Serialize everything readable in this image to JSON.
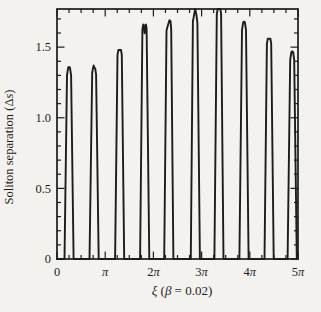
{
  "figure": {
    "background": "#f3f2ee",
    "ink": "#1c1c1c"
  },
  "chart_data": {
    "type": "line",
    "title": "",
    "xlabel": "ξ (β = 0.02)",
    "ylabel": "Soliton separation (Δs)",
    "xlabel_parts": [
      {
        "text": "ξ",
        "italic": true
      },
      {
        "text": " (",
        "italic": false
      },
      {
        "text": "β",
        "italic": true
      },
      {
        "text": " = 0.02)",
        "italic": false
      }
    ],
    "ylabel_parts": [
      {
        "text": "Soliton separation (Δ",
        "italic": false
      },
      {
        "text": "s",
        "italic": true
      },
      {
        "text": ")",
        "italic": false
      }
    ],
    "xlim_pi": [
      0,
      5
    ],
    "ylim": [
      0,
      1.77
    ],
    "x_major_ticks_pi": [
      0,
      1,
      2,
      3,
      4,
      5
    ],
    "x_tick_labels": [
      "0",
      "π",
      "2π",
      "3π",
      "4π",
      "5π"
    ],
    "x_minor_step_pi": 0.25,
    "y_major_ticks": [
      0,
      0.5,
      1.0,
      1.5
    ],
    "y_tick_labels": [
      "0",
      "0.5",
      "1.0",
      "1.5"
    ],
    "y_minor_step": 0.1,
    "grid": false,
    "legend": null,
    "series": [
      {
        "name": "soliton-separation",
        "color": "#1c1c1c",
        "baseline": 0,
        "spike_halfwidth_base_pi": 0.095,
        "spikes": [
          {
            "xi_pi": 0.25,
            "peak": 1.36,
            "top": "rounded"
          },
          {
            "xi_pi": 0.77,
            "peak": 1.37,
            "top": "nub"
          },
          {
            "xi_pi": 1.3,
            "peak": 1.48,
            "top": "flat"
          },
          {
            "xi_pi": 1.82,
            "peak": 1.66,
            "top": "notched"
          },
          {
            "xi_pi": 2.32,
            "peak": 1.69,
            "top": "slant"
          },
          {
            "xi_pi": 2.87,
            "peak": 1.77,
            "top": "pointed"
          },
          {
            "xi_pi": 3.36,
            "peak": 1.77,
            "top": "flat"
          },
          {
            "xi_pi": 3.88,
            "peak": 1.68,
            "top": "rounded"
          },
          {
            "xi_pi": 4.4,
            "peak": 1.56,
            "top": "flat"
          },
          {
            "xi_pi": 4.88,
            "peak": 1.47,
            "top": "rounded"
          }
        ]
      }
    ]
  }
}
